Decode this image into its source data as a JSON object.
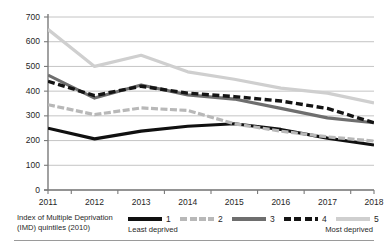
{
  "chart_data": {
    "type": "line",
    "title": "",
    "xlabel": "",
    "ylabel": "Sure Start spend per eligible child (£)",
    "x": [
      "2011",
      "2012",
      "2013",
      "2014",
      "2015",
      "2016",
      "2017",
      "2018"
    ],
    "xlim": [
      "2011",
      "2018"
    ],
    "ylim": [
      0,
      700
    ],
    "yticks": [
      0,
      100,
      200,
      300,
      400,
      500,
      600,
      700
    ],
    "grid": "horizontal",
    "legend_position": "bottom",
    "series": [
      {
        "name": "1",
        "label": "1",
        "style": "solid",
        "color": "#101010",
        "width": 3.2,
        "values": [
          250,
          207,
          238,
          258,
          268,
          245,
          210,
          182
        ]
      },
      {
        "name": "2",
        "label": "2",
        "style": "dashed-light",
        "color": "#b8b8b8",
        "width": 3.2,
        "values": [
          345,
          305,
          332,
          322,
          268,
          238,
          215,
          198
        ]
      },
      {
        "name": "3",
        "label": "3",
        "style": "solid",
        "color": "#6e6e6e",
        "width": 3.2,
        "values": [
          465,
          372,
          425,
          385,
          368,
          330,
          292,
          272
        ]
      },
      {
        "name": "4",
        "label": "4",
        "style": "dashed",
        "color": "#141414",
        "width": 3.4,
        "values": [
          440,
          382,
          420,
          392,
          378,
          360,
          330,
          272
        ]
      },
      {
        "name": "5",
        "label": "5",
        "style": "solid-light",
        "color": "#cfcfcf",
        "width": 3.2,
        "values": [
          650,
          500,
          545,
          478,
          448,
          412,
          392,
          352
        ]
      }
    ],
    "legend": {
      "title_line1": "Index of Multiple Deprivation",
      "title_line2": "(IMD) quintiles (2010)",
      "entries": [
        {
          "label": "1",
          "color": "#101010",
          "style": "solid"
        },
        {
          "label": "2",
          "color": "#b8b8b8",
          "style": "dashed-light"
        },
        {
          "label": "3",
          "color": "#6e6e6e",
          "style": "solid"
        },
        {
          "label": "4",
          "color": "#141414",
          "style": "dashed"
        },
        {
          "label": "5",
          "color": "#cfcfcf",
          "style": "solid-light"
        }
      ],
      "note_left": "Least deprived",
      "note_right": "Most deprived"
    },
    "axis_color": "#7a7a7a",
    "grid_color": "#b5b5b5",
    "text_color": "#1f1f1f"
  }
}
